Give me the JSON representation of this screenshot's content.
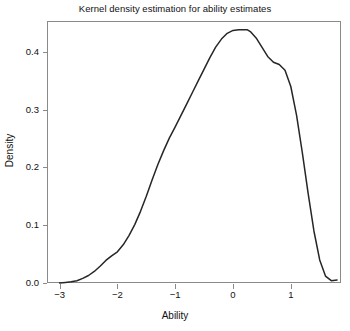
{
  "figure": {
    "title": "Kernel density estimation for ability estimates",
    "background": "#ffffff",
    "line_color": "#262626",
    "axis_color": "#8a8a8a"
  },
  "chart_data": {
    "type": "line",
    "title": "Kernel density estimation for ability estimates",
    "xlabel": "Ability",
    "ylabel": "Density",
    "xlim": [
      -3.55,
      1.9
    ],
    "ylim": [
      -0.012,
      0.465
    ],
    "grid": false,
    "legend": null,
    "xticks": [
      -3,
      -2,
      -1,
      0,
      1
    ],
    "xtick_labels": [
      "−3",
      "−2",
      "−1",
      "0",
      "1"
    ],
    "yticks": [
      0.0,
      0.1,
      0.2,
      0.3,
      0.4
    ],
    "ytick_labels": [
      "0.0",
      "0.1",
      "0.2",
      "0.3",
      "0.4"
    ],
    "series": [
      {
        "name": "density",
        "x": [
          -3.0,
          -2.9,
          -2.8,
          -2.7,
          -2.6,
          -2.5,
          -2.4,
          -2.3,
          -2.2,
          -2.1,
          -2.0,
          -1.9,
          -1.8,
          -1.7,
          -1.6,
          -1.5,
          -1.4,
          -1.3,
          -1.2,
          -1.1,
          -1.0,
          -0.9,
          -0.8,
          -0.7,
          -0.6,
          -0.5,
          -0.4,
          -0.3,
          -0.2,
          -0.1,
          0.0,
          0.1,
          0.2,
          0.25,
          0.3,
          0.4,
          0.5,
          0.6,
          0.7,
          0.8,
          0.9,
          1.0,
          1.1,
          1.2,
          1.3,
          1.4,
          1.5,
          1.6,
          1.7,
          1.8
        ],
        "y": [
          0.0,
          0.001,
          0.002,
          0.004,
          0.008,
          0.013,
          0.02,
          0.029,
          0.039,
          0.047,
          0.054,
          0.066,
          0.082,
          0.101,
          0.124,
          0.15,
          0.178,
          0.205,
          0.229,
          0.251,
          0.27,
          0.29,
          0.31,
          0.33,
          0.35,
          0.37,
          0.39,
          0.408,
          0.422,
          0.432,
          0.437,
          0.438,
          0.438,
          0.438,
          0.435,
          0.424,
          0.408,
          0.392,
          0.382,
          0.378,
          0.368,
          0.34,
          0.29,
          0.225,
          0.155,
          0.09,
          0.04,
          0.012,
          0.004,
          0.005
        ]
      }
    ]
  }
}
